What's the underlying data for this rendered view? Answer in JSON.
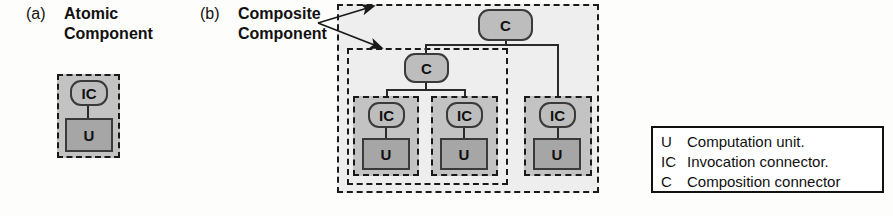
{
  "figure": {
    "part_a": {
      "index": "(a)",
      "title_line1": "Atomic",
      "title_line2": "Component"
    },
    "part_b": {
      "index": "(b)",
      "title_line1": "Composite",
      "title_line2": "Component"
    }
  },
  "labels": {
    "unit": "U",
    "invocation_connector": "IC",
    "composition_connector": "C"
  },
  "atomic_component": {
    "connector": "IC",
    "unit": "U"
  },
  "composite_component": {
    "root_connector": "C",
    "sub_connector": "C",
    "leaves": [
      {
        "connector": "IC",
        "unit": "U"
      },
      {
        "connector": "IC",
        "unit": "U"
      },
      {
        "connector": "IC",
        "unit": "U"
      }
    ]
  },
  "legend": {
    "rows": [
      {
        "key": "U",
        "text": "Computation unit."
      },
      {
        "key": "IC",
        "text": "Invocation connector."
      },
      {
        "key": "C",
        "text": "Composition connector"
      }
    ]
  },
  "colors": {
    "component_fill": "#c3c3c3",
    "group_fill": "#eeeeee",
    "unit_fill": "#a6a6a6",
    "connector_fill": "#bdbdbd",
    "stroke": "#1a1a1a",
    "background": "#fdfdfc"
  }
}
